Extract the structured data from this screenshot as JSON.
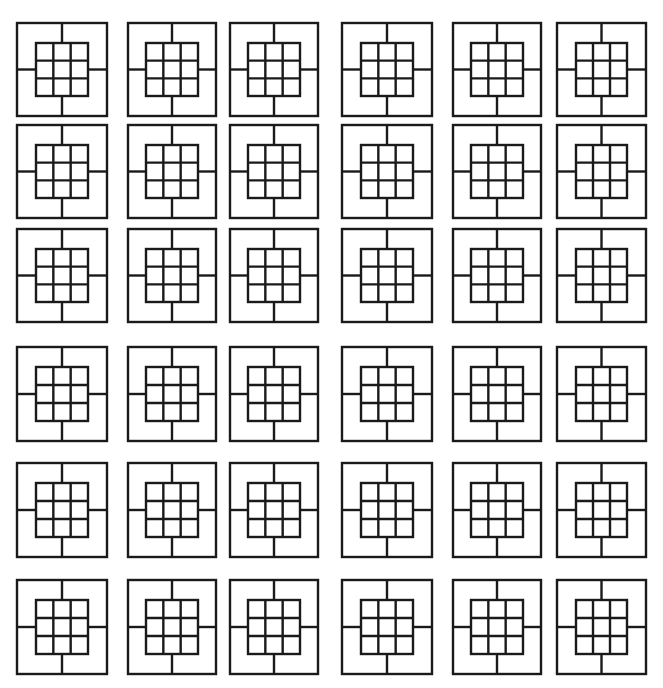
{
  "diagram": {
    "type": "tile-grid",
    "rows": 6,
    "cols": 6,
    "stroke_color": "#1a1a1a",
    "background_color": "#ffffff",
    "stroke_width": 2.4,
    "tile_motif": "outer-square-with-inner-3x3-grid-and-four-connectors",
    "inner_grid": {
      "rows": 3,
      "cols": 3,
      "inset_ratio": 0.21
    },
    "column_x": [
      17,
      128,
      230,
      342,
      453,
      557
    ],
    "column_w": [
      90,
      88,
      88,
      90,
      88,
      89
    ],
    "row_y": [
      23,
      125,
      229,
      347,
      463,
      580
    ],
    "row_h": [
      93,
      93,
      93,
      94,
      94,
      94
    ]
  }
}
